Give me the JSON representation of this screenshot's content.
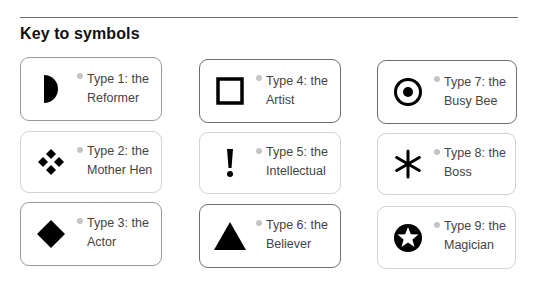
{
  "heading": {
    "title": "Key to symbols"
  },
  "symbols": [
    {
      "type_line": "Type 1: the",
      "name": "Reformer",
      "icon": "half-circle-icon"
    },
    {
      "type_line": "Type 2: the",
      "name": "Mother Hen",
      "icon": "four-diamonds-icon"
    },
    {
      "type_line": "Type 3: the",
      "name": "Actor",
      "icon": "diamond-icon"
    },
    {
      "type_line": "Type 4: the",
      "name": "Artist",
      "icon": "hollow-square-icon"
    },
    {
      "type_line": "Type 5: the",
      "name": "Intellectual",
      "icon": "exclamation-icon"
    },
    {
      "type_line": "Type 6: the",
      "name": "Believer",
      "icon": "triangle-icon"
    },
    {
      "type_line": "Type 7: the",
      "name": "Busy Bee",
      "icon": "dot-in-circle-icon"
    },
    {
      "type_line": "Type 8: the",
      "name": "Boss",
      "icon": "asterisk-icon"
    },
    {
      "type_line": "Type 9: the",
      "name": "Magician",
      "icon": "star-in-circle-icon"
    }
  ],
  "colors": {
    "icon": "#000000",
    "bullet": "#c4c4c4",
    "text": "#444444",
    "rule": "#6b6b6b"
  }
}
